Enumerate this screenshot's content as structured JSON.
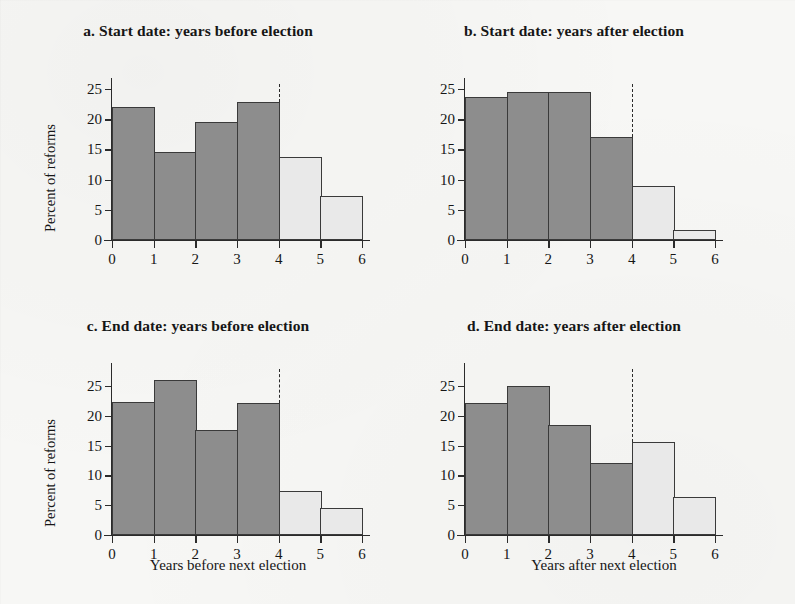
{
  "figure": {
    "background_color": "#f7f7f5",
    "bar_color_dark": "#8d8d8d",
    "bar_color_light": "#e9e9e9",
    "bar_border_color": "#3a3a3a",
    "axis_color": "#2b2b2b"
  },
  "chart_data": [
    {
      "id": "panel-a",
      "type": "bar",
      "title": "a. Start date: years before election",
      "xlabel": "",
      "ylabel": "Percent of reforms",
      "categories": [
        "0-1",
        "1-2",
        "2-3",
        "3-4",
        "4-5",
        "5-6"
      ],
      "bin_edges": [
        0,
        1,
        2,
        3,
        4,
        5,
        6
      ],
      "values": [
        22.0,
        14.6,
        19.6,
        22.9,
        13.8,
        7.3
      ],
      "bar_shades": [
        "dark",
        "dark",
        "dark",
        "dark",
        "light",
        "light"
      ],
      "xlim": [
        0,
        6
      ],
      "ylim": [
        0,
        26.5
      ],
      "xticks": [
        "0",
        "1",
        "2",
        "3",
        "4",
        "5",
        "6"
      ],
      "yticks": [
        "0",
        "5",
        "10",
        "15",
        "20",
        "25"
      ],
      "ytick_values": [
        0,
        5,
        10,
        15,
        20,
        25
      ],
      "annotation_line_x": 4,
      "annotation_line_top": 25.8,
      "grid": false,
      "legend": "none"
    },
    {
      "id": "panel-b",
      "type": "bar",
      "title": "b. Start date: years after election",
      "xlabel": "",
      "ylabel": "",
      "categories": [
        "0-1",
        "1-2",
        "2-3",
        "3-4",
        "4-5",
        "5-6"
      ],
      "bin_edges": [
        0,
        1,
        2,
        3,
        4,
        5,
        6
      ],
      "values": [
        23.7,
        24.5,
        24.5,
        17.1,
        8.9,
        1.6
      ],
      "bar_shades": [
        "dark",
        "dark",
        "dark",
        "dark",
        "light",
        "light"
      ],
      "xlim": [
        0,
        6
      ],
      "ylim": [
        0,
        26.5
      ],
      "xticks": [
        "0",
        "1",
        "2",
        "3",
        "4",
        "5",
        "6"
      ],
      "yticks": [
        "0",
        "5",
        "10",
        "15",
        "20",
        "25"
      ],
      "ytick_values": [
        0,
        5,
        10,
        15,
        20,
        25
      ],
      "annotation_line_x": 4,
      "annotation_line_top": 25.8,
      "grid": false,
      "legend": "none"
    },
    {
      "id": "panel-c",
      "type": "bar",
      "title": "c. End date: years before election",
      "xlabel": "Years before next election",
      "ylabel": "Percent of reforms",
      "categories": [
        "0-1",
        "1-2",
        "2-3",
        "3-4",
        "4-5",
        "5-6"
      ],
      "bin_edges": [
        0,
        1,
        2,
        3,
        4,
        5,
        6
      ],
      "values": [
        22.3,
        26.0,
        17.6,
        22.2,
        7.4,
        4.6
      ],
      "bar_shades": [
        "dark",
        "dark",
        "dark",
        "dark",
        "light",
        "light"
      ],
      "xlim": [
        0,
        6
      ],
      "ylim": [
        0,
        28.5
      ],
      "xticks": [
        "0",
        "1",
        "2",
        "3",
        "4",
        "5",
        "6"
      ],
      "yticks": [
        "0",
        "5",
        "10",
        "15",
        "20",
        "25"
      ],
      "ytick_values": [
        0,
        5,
        10,
        15,
        20,
        25
      ],
      "annotation_line_x": 4,
      "annotation_line_top": 27.8,
      "grid": false,
      "legend": "none"
    },
    {
      "id": "panel-d",
      "type": "bar",
      "title": "d. End date: years after election",
      "xlabel": "Years after next election",
      "ylabel": "",
      "categories": [
        "0-1",
        "1-2",
        "2-3",
        "3-4",
        "4-5",
        "5-6"
      ],
      "bin_edges": [
        0,
        1,
        2,
        3,
        4,
        5,
        6
      ],
      "values": [
        22.2,
        25.0,
        18.5,
        12.0,
        15.6,
        6.4
      ],
      "bar_shades": [
        "dark",
        "dark",
        "dark",
        "dark",
        "light",
        "light"
      ],
      "xlim": [
        0,
        6
      ],
      "ylim": [
        0,
        28.5
      ],
      "xticks": [
        "0",
        "1",
        "2",
        "3",
        "4",
        "5",
        "6"
      ],
      "yticks": [
        "0",
        "5",
        "10",
        "15",
        "20",
        "25"
      ],
      "ytick_values": [
        0,
        5,
        10,
        15,
        20,
        25
      ],
      "annotation_line_x": 4,
      "annotation_line_top": 27.8,
      "grid": false,
      "legend": "none"
    }
  ]
}
